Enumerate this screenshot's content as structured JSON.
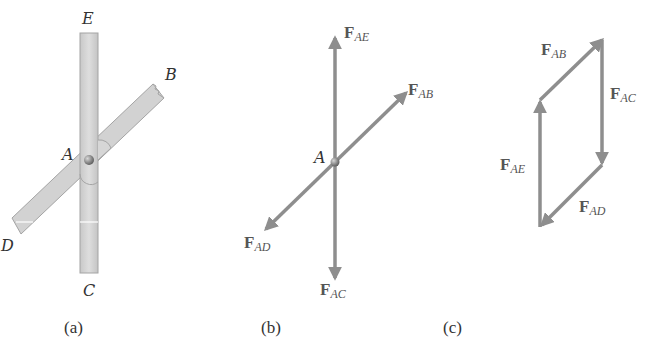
{
  "colors": {
    "background": "#ffffff",
    "bar_fill": "#d4d4d4",
    "bar_edge": "#a8a8a8",
    "arrow": "#8e8e8e",
    "pin": "#7a7a7a",
    "label": "#333333",
    "force_label": "#555555"
  },
  "panel_a": {
    "caption": "(a)",
    "labels": {
      "E": "E",
      "B": "B",
      "A": "A",
      "D": "D",
      "C": "C"
    }
  },
  "panel_b": {
    "caption": "(b)",
    "point_label": "A",
    "forces": [
      {
        "id": "F_AE",
        "main": "F",
        "sub": "AE",
        "direction": "up"
      },
      {
        "id": "F_AB",
        "main": "F",
        "sub": "AB",
        "direction": "up-right"
      },
      {
        "id": "F_AD",
        "main": "F",
        "sub": "AD",
        "direction": "down-left"
      },
      {
        "id": "F_AC",
        "main": "F",
        "sub": "AC",
        "direction": "down"
      }
    ]
  },
  "panel_c": {
    "caption": "(c)",
    "forces": [
      {
        "id": "F_AB",
        "main": "F",
        "sub": "AB"
      },
      {
        "id": "F_AC",
        "main": "F",
        "sub": "AC"
      },
      {
        "id": "F_AD",
        "main": "F",
        "sub": "AD"
      },
      {
        "id": "F_AE",
        "main": "F",
        "sub": "AE"
      }
    ]
  }
}
